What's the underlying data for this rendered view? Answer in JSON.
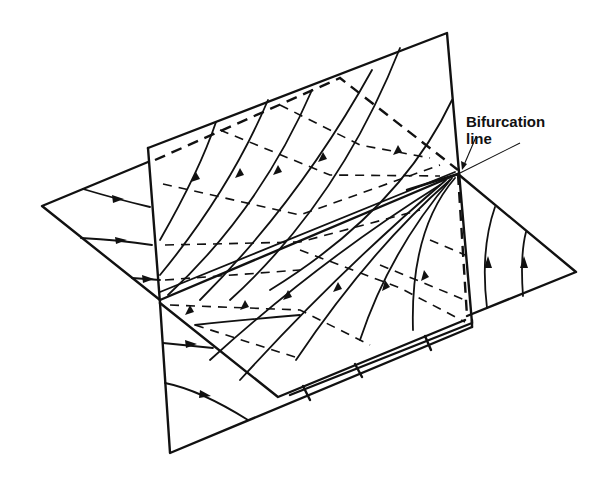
{
  "diagram": {
    "title": "",
    "annotation": {
      "line1": "Bifurcation",
      "line2": "line"
    },
    "elements": [
      "vertical-plane",
      "horizontal-plane",
      "bifurcation-line",
      "streamlines-with-arrows",
      "hidden-dashed-lines"
    ],
    "colors": {
      "ink": "#111111",
      "background": "#ffffff"
    }
  }
}
